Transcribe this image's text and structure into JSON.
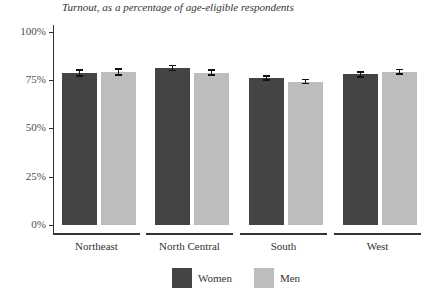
{
  "chart_data": {
    "type": "bar",
    "title": "",
    "subtitle": "Turnout, as a percentage of age-eligible respondents",
    "xlabel": "",
    "ylabel": "",
    "ylim": [
      0,
      100
    ],
    "yticks": [
      "0%",
      "25%",
      "50%",
      "75%",
      "100%"
    ],
    "categories": [
      "Northeast",
      "North Central",
      "South",
      "West"
    ],
    "series": [
      {
        "name": "Women",
        "color": "#444444",
        "values": [
          78.8,
          81.3,
          76.2,
          78.0
        ],
        "error": [
          1.9,
          1.7,
          1.4,
          1.6
        ]
      },
      {
        "name": "Men",
        "color": "#bdbdbd",
        "values": [
          79.2,
          79.0,
          74.3,
          79.4
        ],
        "error": [
          1.9,
          1.7,
          1.4,
          1.6
        ]
      }
    ],
    "legend_position": "bottom",
    "grid": false
  },
  "legend": {
    "women": "Women",
    "men": "Men"
  }
}
